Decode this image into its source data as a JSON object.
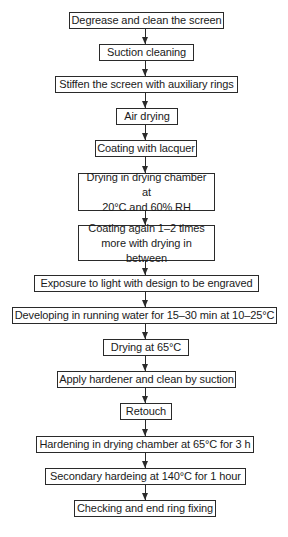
{
  "diagram": {
    "type": "flowchart",
    "direction": "top-to-bottom",
    "steps": [
      {
        "id": 1,
        "label": "Degrease and clean the screen"
      },
      {
        "id": 2,
        "label": "Suction cleaning"
      },
      {
        "id": 3,
        "label": "Stiffen the screen with auxiliary rings"
      },
      {
        "id": 4,
        "label": "Air drying"
      },
      {
        "id": 5,
        "label": "Coating with lacquer"
      },
      {
        "id": 6,
        "label": "Drying in drying chamber at 20°C and 60% RH",
        "line1": "Drying in drying chamber at",
        "line2": "20°C and 60% RH"
      },
      {
        "id": 7,
        "label": "Coating again 1–2 times more with drying in between",
        "line1": "Coating again 1–2 times",
        "line2": "more with drying in between"
      },
      {
        "id": 8,
        "label": "Exposure to light with design to be engraved"
      },
      {
        "id": 9,
        "label": "Developing in running water for 15–30 min at 10–25°C"
      },
      {
        "id": 10,
        "label": "Drying at 65°C"
      },
      {
        "id": 11,
        "label": "Apply hardener and clean by suction"
      },
      {
        "id": 12,
        "label": "Retouch"
      },
      {
        "id": 13,
        "label": "Hardening in drying chamber at 65°C for 3 h"
      },
      {
        "id": 14,
        "label": "Secondary hardeing at 140°C for 1 hour"
      },
      {
        "id": 15,
        "label": "Checking and end ring fixing"
      }
    ],
    "edges": [
      [
        1,
        2
      ],
      [
        2,
        3
      ],
      [
        3,
        4
      ],
      [
        4,
        5
      ],
      [
        5,
        6
      ],
      [
        6,
        7
      ],
      [
        7,
        8
      ],
      [
        8,
        9
      ],
      [
        9,
        10
      ],
      [
        10,
        11
      ],
      [
        11,
        12
      ],
      [
        12,
        13
      ],
      [
        13,
        14
      ],
      [
        14,
        15
      ]
    ],
    "colors": {
      "stroke": "#2a2a2a",
      "background": "#ffffff",
      "text": "#1a1a1a"
    }
  }
}
